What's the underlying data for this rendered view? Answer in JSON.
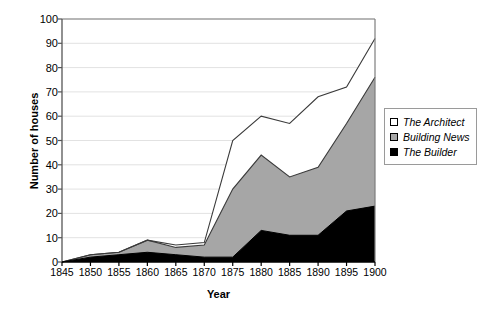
{
  "chart_data": {
    "type": "area",
    "stacked": true,
    "title": "",
    "xlabel": "Year",
    "ylabel": "Number of houses",
    "x": [
      1845,
      1850,
      1855,
      1860,
      1865,
      1870,
      1875,
      1880,
      1885,
      1890,
      1895,
      1900
    ],
    "xticklabels": [
      "1845",
      "1850",
      "1855",
      "1860",
      "1865",
      "1870",
      "1875",
      "1880",
      "1885",
      "1890",
      "1895",
      "1900"
    ],
    "yticklabels": [
      "0",
      "10",
      "20",
      "30",
      "40",
      "50",
      "60",
      "70",
      "80",
      "90",
      "100"
    ],
    "ylim": [
      0,
      100
    ],
    "xlim": [
      1845,
      1900
    ],
    "ytick_step": 10,
    "grid": "horizontal",
    "legend_position": "right",
    "series": [
      {
        "name": "The Builder",
        "color": "#000000",
        "values": [
          0,
          2,
          3,
          4,
          3,
          2,
          2,
          13,
          11,
          11,
          21,
          23
        ]
      },
      {
        "name": "Building News",
        "color": "#a6a6a6",
        "values": [
          0,
          1,
          1,
          5,
          3,
          5,
          28,
          31,
          24,
          28,
          36,
          53
        ]
      },
      {
        "name": "The Architect",
        "color": "#ffffff",
        "values": [
          0,
          0,
          0,
          0,
          1,
          1,
          20,
          16,
          22,
          29,
          15,
          16
        ]
      }
    ],
    "cumulative": {
      "builder_top": [
        0,
        2,
        3,
        4,
        3,
        2,
        2,
        13,
        11,
        11,
        21,
        23
      ],
      "building_news_top": [
        0,
        3,
        4,
        9,
        6,
        7,
        30,
        44,
        35,
        39,
        57,
        76
      ],
      "architect_top": [
        0,
        3,
        4,
        9,
        7,
        8,
        50,
        60,
        57,
        68,
        72,
        92
      ]
    }
  },
  "legend": {
    "items": [
      {
        "label": "The Architect",
        "swatch": "#ffffff"
      },
      {
        "label": "Building News",
        "swatch": "#a6a6a6"
      },
      {
        "label": "The Builder",
        "swatch": "#000000"
      }
    ]
  },
  "axes": {
    "y_title": "Number of houses",
    "x_title": "Year"
  }
}
